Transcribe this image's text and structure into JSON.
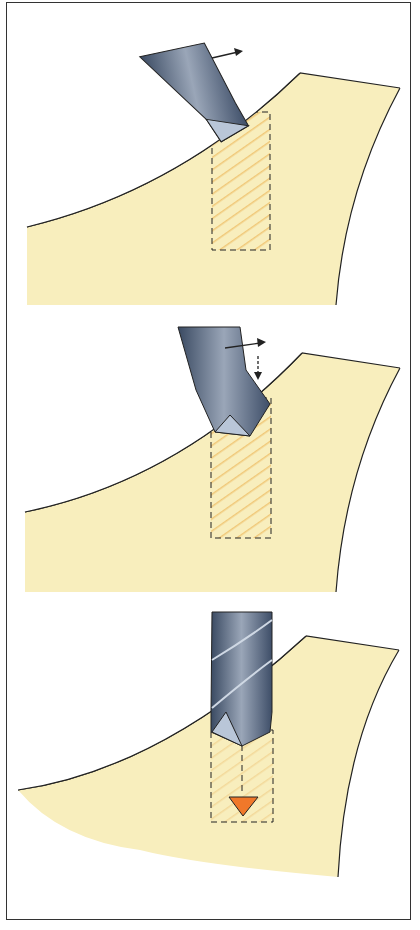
{
  "diagram": {
    "colors": {
      "material_fill": "#f8eebd",
      "hatch": "#f0c878",
      "drill_dark": "#3a4a62",
      "drill_mid": "#6e7f9a",
      "drill_light": "#b9c6d8",
      "outline": "#222222",
      "marker": "#f0782a"
    },
    "steps": [
      {
        "label": "1",
        "description": "Drill tilted, starting to bite on sloped surface; arrow indicates motion to the right"
      },
      {
        "label": "2",
        "description": "Drill pushed sideways with dashed downward arrow indicating feed"
      },
      {
        "label": "3",
        "description": "Drill vertical, drilling down; orange triangle marks hole bottom"
      }
    ]
  }
}
